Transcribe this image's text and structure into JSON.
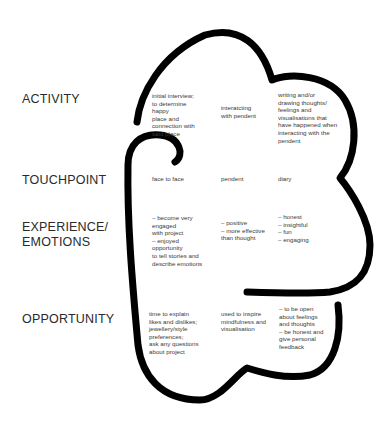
{
  "rows": [
    {
      "label": "ACTIVITY"
    },
    {
      "label": "TOUCHPOINT"
    },
    {
      "label": "EXPERIENCE/\nEMOTIONS"
    },
    {
      "label": "OPPORTUNITY"
    }
  ],
  "activity": {
    "col1": "initial interview;\nto determine\nhappy\nplace and\nconnection with\nsaid place",
    "col2": "interatcting\nwith pendent",
    "col3": "writing and/or\ndrawing thoughts/\nfeelings and\nvisualisations that\nhave happened when\ninteracting with the\npendent"
  },
  "touchpoint": {
    "col1": "face to face",
    "col2": "pendent",
    "col3": "diary"
  },
  "experience": {
    "col1": "– become very\nengaged\n with project\n– enjoyed\nopportunity\nto tell stories and\ndescribe emotions",
    "col2": "– positive\n– more effective\nthan thought",
    "col3": "– honest\n– insightful\n– fun\n– engaging"
  },
  "opportunity": {
    "col1": "time to explain\nlikes and dislikes;\njewellery/style\npreferences;\nask any questions\n about project",
    "col2": "used to inspire\nmindfulness and\nvisualisation",
    "col3": "– to be open\nabout feelings\nand thoughts\n– be honest and\ngive personal\nfeedback"
  },
  "colors": {
    "stroke": "#000000",
    "text": "#3a3a3a",
    "background": "#ffffff"
  }
}
